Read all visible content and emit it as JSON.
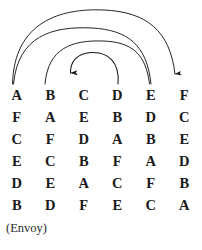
{
  "figure": {
    "caption": "(Envoy)",
    "ink_color": "#1a1a1a",
    "background_color": "#ffffff",
    "width": 201,
    "height": 250
  },
  "grid": {
    "columns": 6,
    "rows": 6,
    "header_row_labels": [
      "A",
      "B",
      "C",
      "D",
      "E",
      "F"
    ],
    "cells": [
      [
        "A",
        "B",
        "C",
        "D",
        "E",
        "F"
      ],
      [
        "F",
        "A",
        "E",
        "B",
        "D",
        "C"
      ],
      [
        "C",
        "F",
        "D",
        "A",
        "B",
        "E"
      ],
      [
        "E",
        "C",
        "B",
        "F",
        "A",
        "D"
      ],
      [
        "D",
        "E",
        "A",
        "C",
        "F",
        "B"
      ],
      [
        "B",
        "D",
        "F",
        "E",
        "C",
        "A"
      ]
    ]
  },
  "arcs": [
    {
      "name": "arc-a-to-f",
      "from_label": "A",
      "to_label": "F",
      "arrowhead": "at-end",
      "arrowhead_direction": "down",
      "order": "outermost"
    },
    {
      "name": "arc-a-to-e",
      "from_label": "A",
      "to_label": "E",
      "arrowhead": "none",
      "arrowhead_direction": "",
      "order": "second"
    },
    {
      "name": "arc-b-to-e",
      "from_label": "B",
      "to_label": "E",
      "arrowhead": "none",
      "arrowhead_direction": "",
      "order": "third"
    },
    {
      "name": "arc-d-to-c",
      "from_label": "D",
      "to_label": "C",
      "arrowhead": "at-end",
      "arrowhead_direction": "down",
      "order": "innermost"
    }
  ]
}
